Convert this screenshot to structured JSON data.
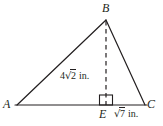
{
  "figure": {
    "kind": "triangle-with-altitude",
    "shape_name": "triangle ABC",
    "colors": {
      "stroke": "#231f20",
      "background": "#ffffff",
      "text": "#231f20"
    },
    "vertices": [
      {
        "id": "B",
        "label": "B",
        "x": 106,
        "y": 20
      },
      {
        "id": "A",
        "label": "A",
        "x": 17,
        "y": 105
      },
      {
        "id": "C",
        "label": "C",
        "x": 145,
        "y": 105
      }
    ],
    "points": [
      {
        "id": "E",
        "label": "E",
        "x": 106,
        "y": 105
      }
    ],
    "segments": [
      {
        "from": "A",
        "to": "B",
        "style": "solid"
      },
      {
        "from": "B",
        "to": "C",
        "style": "solid"
      },
      {
        "from": "A",
        "to": "C",
        "style": "solid"
      },
      {
        "from": "B",
        "to": "E",
        "style": "dashed"
      }
    ],
    "right_angle": {
      "at": "E",
      "marker": "square",
      "size": 13
    },
    "measures": [
      {
        "id": "altitude",
        "segment": "BE",
        "coefficient": "4",
        "radicand": "2",
        "unit": "in.",
        "text": "4√2 in."
      },
      {
        "id": "base-segment",
        "segment": "EC",
        "coefficient": "",
        "radicand": "7",
        "unit": "in.",
        "text": "√7 in."
      }
    ]
  }
}
